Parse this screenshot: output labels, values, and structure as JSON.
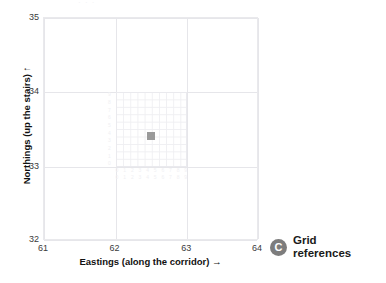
{
  "figure": {
    "clipped_title": "· · ·"
  },
  "chart_data": {
    "type": "scatter",
    "title": "",
    "xlabel": "Eastings (along the corridor)  →",
    "ylabel": "Northings (up the stairs)  ↑",
    "xlabel_text": "Eastings (along the corridor)",
    "ylabel_text": "Northings (up the stairs)",
    "xlabel_arrow": "→",
    "ylabel_arrow": "↑",
    "xlim": [
      61,
      64
    ],
    "ylim": [
      32,
      35
    ],
    "xticks": [
      "61",
      "62",
      "63",
      "64"
    ],
    "yticks": [
      "32",
      "33",
      "34",
      "35"
    ],
    "grid": true,
    "major_grid_spacing": 1,
    "minor_grid": {
      "visible": true,
      "region_x": [
        62,
        63
      ],
      "region_y": [
        33,
        34
      ],
      "divisions": 10,
      "ruler_digits": [
        "0",
        "1",
        "2",
        "3",
        "4",
        "5",
        "6",
        "7",
        "8",
        "9"
      ]
    },
    "series": [
      {
        "name": "grid reference point",
        "marker": "square",
        "color": "#9a9a9a",
        "x": [
          62.5
        ],
        "y": [
          33.4
        ]
      }
    ],
    "legend": {
      "visible": false
    }
  },
  "badge": {
    "letter": "C",
    "label_line1": "Grid",
    "label_line2": "references",
    "color": "#7d7d7d"
  }
}
